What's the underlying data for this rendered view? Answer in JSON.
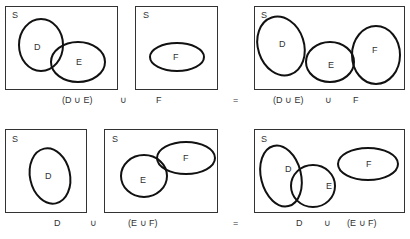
{
  "universe_label": "S",
  "rows": [
    {
      "name": "top",
      "panels": [
        {
          "universe": "S",
          "sets": [
            "D",
            "E"
          ],
          "caption": "(D ∪ E)"
        },
        {
          "universe": "S",
          "sets": [
            "F"
          ],
          "caption": "F"
        },
        {
          "universe": "S",
          "sets": [
            "D",
            "E",
            "F"
          ],
          "caption_left": "(D ∪ E)",
          "caption_op": "∪",
          "caption_right": "F"
        }
      ],
      "operator": "∪",
      "equals": "="
    },
    {
      "name": "bottom",
      "panels": [
        {
          "universe": "S",
          "sets": [
            "D"
          ],
          "caption": "D"
        },
        {
          "universe": "S",
          "sets": [
            "E",
            "F"
          ],
          "caption": "(E ∪ F)"
        },
        {
          "universe": "S",
          "sets": [
            "D",
            "E",
            "F"
          ],
          "caption_left": "D",
          "caption_op": "∪",
          "caption_right": "(E ∪ F)"
        }
      ],
      "operator": "∪",
      "equals": "="
    }
  ]
}
